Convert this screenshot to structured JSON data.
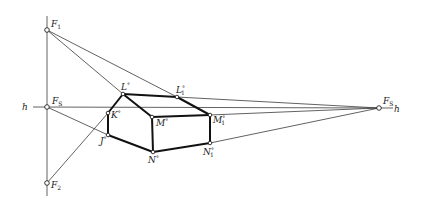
{
  "diagram": {
    "type": "two-point perspective construction of a house",
    "horizon_label": "h",
    "points": {
      "F1": {
        "label": "F",
        "sub": "1",
        "sup": "",
        "x": 47,
        "y": 30
      },
      "F2": {
        "label": "F",
        "sub": "2",
        "sup": "",
        "x": 47,
        "y": 183
      },
      "FS_left": {
        "label": "F",
        "sub": "S",
        "sup": "",
        "x": 47,
        "y": 107
      },
      "FS_right": {
        "label": "F",
        "sub": "S",
        "sup": "",
        "x": 379,
        "y": 108
      },
      "L": {
        "label": "L",
        "sub": "",
        "sup": "o",
        "x": 123,
        "y": 94
      },
      "L1": {
        "label": "L",
        "sub": "1",
        "sup": "o",
        "x": 177,
        "y": 97
      },
      "K": {
        "label": "K",
        "sub": "",
        "sup": "o",
        "x": 108,
        "y": 113
      },
      "J": {
        "label": "J",
        "sub": "",
        "sup": "o",
        "x": 108,
        "y": 135
      },
      "M": {
        "label": "M",
        "sub": "",
        "sup": "o",
        "x": 152,
        "y": 117
      },
      "M1": {
        "label": "M",
        "sub": "1",
        "sup": "o",
        "x": 210,
        "y": 115
      },
      "N": {
        "label": "N",
        "sub": "",
        "sup": "o",
        "x": 153,
        "y": 152
      },
      "N1": {
        "label": "N",
        "sub": "1",
        "sup": "o",
        "x": 210,
        "y": 143
      }
    },
    "labels": {
      "h_left": "h",
      "h_right": "h",
      "F1": "F",
      "F1_sub": "1",
      "F2": "F",
      "F2_sub": "2",
      "FS_left": "F",
      "FS_left_sub": "S",
      "FS_right": "F",
      "FS_right_sub": "S",
      "L": "L",
      "L1": "L",
      "L1_sub": "1",
      "K": "K",
      "J": "J",
      "M": "M",
      "M1": "M",
      "M1_sub": "1",
      "N": "N",
      "N1": "N",
      "N1_sub": "1",
      "deg": "°"
    }
  }
}
